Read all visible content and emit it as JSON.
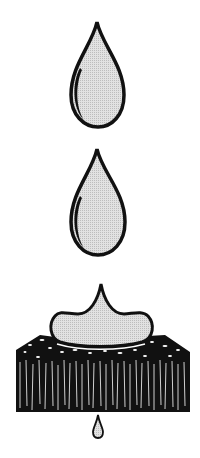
{
  "illustration": {
    "description": "Water drops falling onto an absorbent fibrous pad; a drop spreads on top and a small drop seeps out below",
    "colors": {
      "outline": "#111111",
      "fill": "#d9d9d9",
      "background": "#ffffff"
    },
    "elements": [
      {
        "name": "falling-drop-1"
      },
      {
        "name": "falling-drop-2"
      },
      {
        "name": "spreading-puddle"
      },
      {
        "name": "absorbent-pad"
      },
      {
        "name": "seeping-drop"
      }
    ]
  }
}
